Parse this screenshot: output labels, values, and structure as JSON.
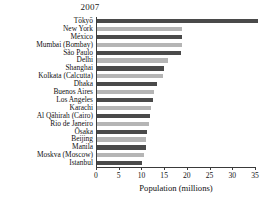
{
  "chart_data": {
    "type": "bar",
    "orientation": "horizontal",
    "title": "2007",
    "xlabel": "Population (millions)",
    "ylabel": "",
    "xlim": [
      0,
      35
    ],
    "xticks": [
      0,
      5,
      10,
      15,
      20,
      25,
      30,
      35
    ],
    "grid": false,
    "legend": false,
    "bar_colors": [
      "#4a4a4a",
      "#b5b5b5"
    ],
    "bar_color_pattern": "alternating-dark-light",
    "categories": [
      "Tōkyō",
      "New York",
      "México",
      "Mumbai (Bombay)",
      "São Paulo",
      "Delhi",
      "Shanghai",
      "Kolkata (Calcutta)",
      "Dhaka",
      "Buenos Aires",
      "Los Angeles",
      "Karachi",
      "Al Qāhirah (Cairo)",
      "Rio de Janeiro",
      "Ōsaka",
      "Beijing",
      "Manila",
      "Moskva (Moscow)",
      "Istanbul"
    ],
    "values": [
      35.7,
      19.0,
      19.0,
      19.0,
      18.8,
      15.9,
      15.0,
      14.8,
      13.5,
      12.8,
      12.5,
      12.1,
      11.9,
      11.7,
      11.3,
      11.1,
      11.1,
      10.5,
      10.1
    ],
    "value_unit": "millions"
  }
}
